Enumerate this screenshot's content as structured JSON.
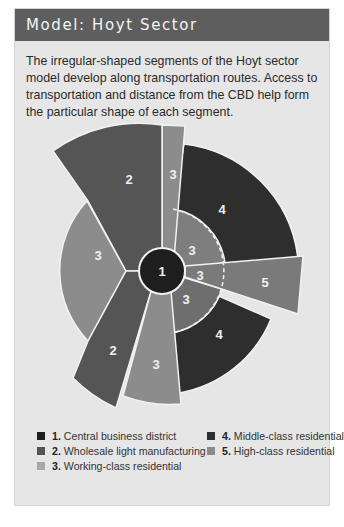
{
  "title": "Model: Hoyt Sector",
  "description": "The irregular-shaped segments of the Hoyt sector model develop along transportation routes. Access to transportation and distance from the CBD help form the particular shape of each segment.",
  "colors": {
    "header_bg": "#5e5e5e",
    "panel_bg": "#e6e6e6",
    "zone1": "#1e1e1e",
    "zone2": "#555555",
    "zone3": "#8c8c8c",
    "zone4": "#2e2e2e",
    "zone5": "#7a7a7a"
  },
  "diagram": {
    "center_label": "1",
    "segments": [
      {
        "id": "seg-2-top",
        "zone": 2,
        "label": "2"
      },
      {
        "id": "seg-3-top-strip",
        "zone": 3,
        "label": "3"
      },
      {
        "id": "seg-4-upper",
        "zone": 4,
        "label": "4"
      },
      {
        "id": "seg-3-inner-upper",
        "zone": 3,
        "label": "3"
      },
      {
        "id": "seg-3-inner-middle",
        "zone": 3,
        "label": "3"
      },
      {
        "id": "seg-5",
        "zone": 5,
        "label": "5"
      },
      {
        "id": "seg-3-inner-lower",
        "zone": 3,
        "label": "3"
      },
      {
        "id": "seg-4-lower",
        "zone": 4,
        "label": "4"
      },
      {
        "id": "seg-3-bottom",
        "zone": 3,
        "label": "3"
      },
      {
        "id": "seg-2-bottom",
        "zone": 2,
        "label": "2"
      },
      {
        "id": "seg-3-left",
        "zone": 3,
        "label": "3"
      }
    ]
  },
  "legend": {
    "items": [
      {
        "num": "1.",
        "label": "Central business district"
      },
      {
        "num": "2.",
        "label": "Wholesale light manufacturing"
      },
      {
        "num": "3.",
        "label": "Working-class residential"
      },
      {
        "num": "4.",
        "label": "Middle-class residential"
      },
      {
        "num": "5.",
        "label": "High-class residential"
      }
    ]
  }
}
